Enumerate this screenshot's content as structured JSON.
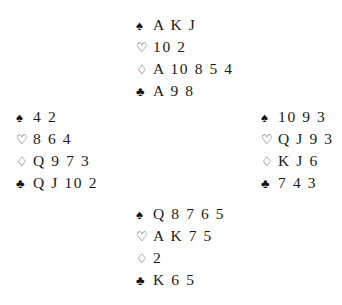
{
  "diagram": {
    "type": "bridge-deal",
    "background_color": "#ffffff",
    "text_color": "#1a1a1a",
    "suit_symbols": {
      "spade": "♠",
      "heart": "♡",
      "diamond": "♢",
      "club": "♣"
    },
    "suit_fill": {
      "spade": "solid",
      "heart": "hollow",
      "diamond": "hollow",
      "club": "solid"
    },
    "hands": {
      "north": {
        "spades": "A K J",
        "hearts": "10 2",
        "diamonds": "A 10 8 5 4",
        "clubs": "A 9 8"
      },
      "west": {
        "spades": "4 2",
        "hearts": "8 6 4",
        "diamonds": "Q 9 7 3",
        "clubs": "Q J 10 2"
      },
      "east": {
        "spades": "10 9 3",
        "hearts": "Q J 9 3",
        "diamonds": "K J 6",
        "clubs": "7 4 3"
      },
      "south": {
        "spades": "Q 8 7 6 5",
        "hearts": "A K 7 5",
        "diamonds": "2",
        "clubs": "K 6 5"
      }
    }
  }
}
